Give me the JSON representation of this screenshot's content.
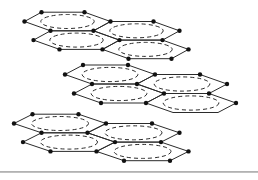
{
  "background": "#ffffff",
  "diagram": {
    "type": "layered-hexagonal-lattice",
    "canvas": {
      "width": 258,
      "height": 180
    },
    "stroke_color": "#2b2b2b",
    "dot_color": "#111111",
    "line_width": 1,
    "dot_radius": 2.2,
    "ellipse_dash": "4 3",
    "ellipse_rx_ratio": 0.62,
    "ellipse_ry_ratio": 0.75,
    "layers": [
      {
        "name": "top",
        "cx": 67.5,
        "cy": 21.5,
        "R": 43,
        "hh": 9.3,
        "s": 4.5,
        "omit_dots": []
      },
      {
        "name": "middle",
        "cx": 110,
        "cy": 74.5,
        "R": 45,
        "hh": 9.5,
        "s": 4.5,
        "omit_dots": [
          "BL4",
          "BR4"
        ]
      },
      {
        "name": "bottom",
        "cx": 60,
        "cy": 123.5,
        "R": 46,
        "hh": 9.3,
        "s": 4.5,
        "omit_dots": []
      }
    ],
    "baseline_rule": {
      "y": 171,
      "thickness": 1.8,
      "color": "#b2b2b2"
    }
  }
}
